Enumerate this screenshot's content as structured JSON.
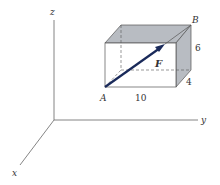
{
  "figure": {
    "axes": {
      "x": "x",
      "y": "y",
      "z": "z"
    },
    "points": {
      "start": "A",
      "end": "B"
    },
    "force_label": "F",
    "dimensions": {
      "length": "10",
      "height": "6",
      "depth": "4"
    },
    "colors": {
      "vector": "#1a2a5a",
      "shade": "#b8bcc2",
      "line": "#555555"
    }
  }
}
